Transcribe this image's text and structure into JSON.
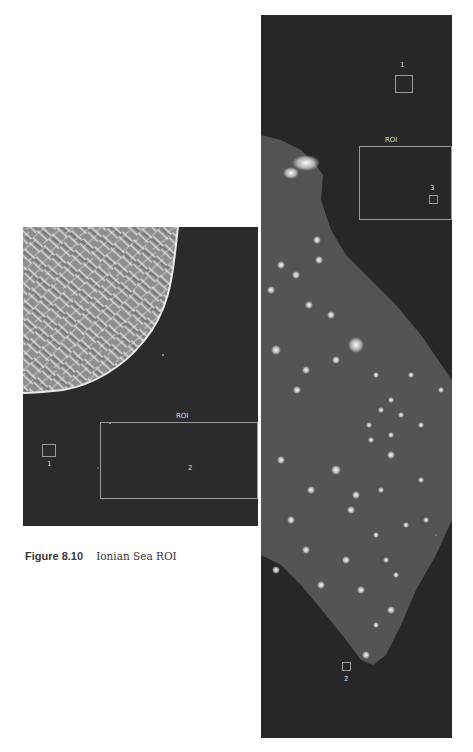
{
  "caption": {
    "figure_number": "Figure 8.10",
    "title": "Ionian Sea ROI"
  },
  "left_image": {
    "roi_label": "ROI",
    "markers": [
      {
        "label": "1"
      },
      {
        "label": "2"
      }
    ]
  },
  "right_image": {
    "roi_label": "ROI",
    "markers": [
      {
        "label": "1"
      },
      {
        "label": "3"
      },
      {
        "label": "2"
      }
    ]
  },
  "colors": {
    "sea": "#2b2b2b",
    "land_left": "#9a9a9a",
    "land_right": "#555555",
    "roi_outline": "#9a9a9a",
    "background": "#ffffff"
  }
}
